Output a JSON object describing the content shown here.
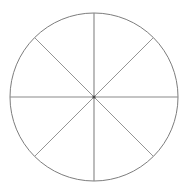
{
  "figure": {
    "canvas": {
      "width": 189,
      "height": 194,
      "background_color": "#ffffff"
    }
  },
  "chart_data": {
    "type": "pie",
    "title": "",
    "subtitle": "",
    "xlabel": "",
    "ylabel": "",
    "grid": false,
    "legend": "none",
    "labels_shown": false,
    "categories": [
      "1",
      "2",
      "3",
      "4",
      "5",
      "6",
      "7",
      "8"
    ],
    "values": [
      12.5,
      12.5,
      12.5,
      12.5,
      12.5,
      12.5,
      12.5,
      12.5
    ],
    "units": "percent",
    "slice_count": 8,
    "slice_angle_degrees": 45,
    "fraction_per_slice": "1/8",
    "start_angle_degrees": 90,
    "geometry": {
      "center_x": 94,
      "center_y": 97,
      "radius": 84,
      "outline_color": "#7d7d7d",
      "outline_width": 1,
      "fill": "none"
    },
    "spokes": [
      {
        "name": "vertical-diameter",
        "angle_degrees": 90,
        "style": "axis",
        "color": "#8a8a8a"
      },
      {
        "name": "horizontal-diameter",
        "angle_degrees": 0,
        "style": "axis",
        "color": "#8a8a8a"
      },
      {
        "name": "diagonal-diameter-45",
        "angle_degrees": 45,
        "style": "diagonal",
        "color": "#949494"
      },
      {
        "name": "diagonal-diameter-135",
        "angle_degrees": 135,
        "style": "diagonal",
        "color": "#949494"
      }
    ],
    "center_marker": {
      "shown": true,
      "radius": 1.6,
      "color": "#4a4a4a"
    }
  }
}
